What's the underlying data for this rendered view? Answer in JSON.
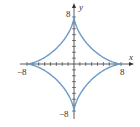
{
  "chart_data": {
    "type": "line",
    "title": "",
    "xlabel": "x",
    "ylabel": "y",
    "xlim": [
      -8,
      8
    ],
    "ylim": [
      -8,
      8
    ],
    "x_tick_labels": [
      "-8",
      "8"
    ],
    "y_tick_labels": [
      "8",
      "-8"
    ],
    "tick_step": 1,
    "grid": false,
    "legend": null,
    "series": [
      {
        "name": "astroid",
        "color": "#6a9ac9",
        "parametric": "x = 8cos^3(t), y = 8sin^3(t)",
        "cusps": [
          [
            8,
            0
          ],
          [
            0,
            8
          ],
          [
            -8,
            0
          ],
          [
            0,
            -8
          ]
        ]
      }
    ]
  },
  "labels": {
    "x_axis": "x",
    "y_axis": "y",
    "x_min": "−8",
    "x_max": "8",
    "y_max": "8",
    "y_min": "−8"
  },
  "colors": {
    "curve": "#6a9ac9",
    "axis": "#333333"
  }
}
